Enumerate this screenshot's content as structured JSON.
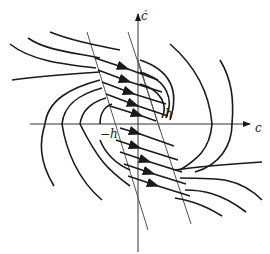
{
  "diagram": {
    "type": "phase-plane",
    "axes": {
      "x_label": "c",
      "y_label": "ċ"
    },
    "annotations": {
      "switch_upper": "h",
      "switch_lower": "−h"
    },
    "colors": {
      "trajectory": "#1a1a1a",
      "axis": "#333333",
      "switching_line": "#555555",
      "background": "#ffffff"
    }
  }
}
